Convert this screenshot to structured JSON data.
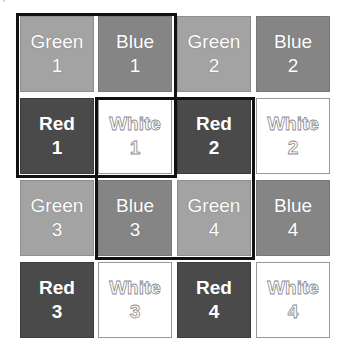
{
  "grid": {
    "rows": [
      [
        {
          "color": "green",
          "label": "Green",
          "num": "1"
        },
        {
          "color": "blue",
          "label": "Blue",
          "num": "1"
        },
        {
          "color": "green",
          "label": "Green",
          "num": "2"
        },
        {
          "color": "blue",
          "label": "Blue",
          "num": "2"
        }
      ],
      [
        {
          "color": "red",
          "label": "Red",
          "num": "1"
        },
        {
          "color": "white",
          "label": "White",
          "num": "1"
        },
        {
          "color": "red",
          "label": "Red",
          "num": "2"
        },
        {
          "color": "white",
          "label": "White",
          "num": "2"
        }
      ],
      [
        {
          "color": "green",
          "label": "Green",
          "num": "3"
        },
        {
          "color": "blue",
          "label": "Blue",
          "num": "3"
        },
        {
          "color": "green",
          "label": "Green",
          "num": "4"
        },
        {
          "color": "blue",
          "label": "Blue",
          "num": "4"
        }
      ],
      [
        {
          "color": "red",
          "label": "Red",
          "num": "3"
        },
        {
          "color": "white",
          "label": "White",
          "num": "3"
        },
        {
          "color": "red",
          "label": "Red",
          "num": "4"
        },
        {
          "color": "white",
          "label": "White",
          "num": "4"
        }
      ]
    ]
  },
  "highlights": [
    {
      "name": "top-left-2x2",
      "rows": [
        0,
        1
      ],
      "cols": [
        0,
        1
      ]
    },
    {
      "name": "center-2x2",
      "rows": [
        1,
        2
      ],
      "cols": [
        1,
        2
      ]
    }
  ],
  "colors": {
    "green": "#a3a3a3",
    "blue": "#858585",
    "red": "#4a4a4a",
    "white": "#ffffff",
    "outline": "#111111"
  }
}
